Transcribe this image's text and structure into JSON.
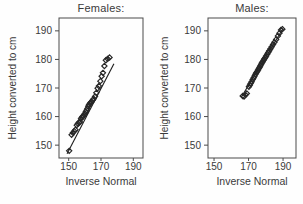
{
  "figure": {
    "background": "#fefefe",
    "text_color": "#3a3a3a",
    "box_color": "#4a4a4a",
    "marker_color": "#272727",
    "fit_line_color": "#1c1c1c"
  },
  "chart_data": [
    {
      "type": "scatter",
      "title": "Females:",
      "xlabel": "Inverse Normal",
      "ylabel": "Height converted to cm",
      "xlim": [
        144,
        196
      ],
      "ylim": [
        145.5,
        194.5
      ],
      "xticks": [
        150,
        170,
        190
      ],
      "yticks": [
        150,
        160,
        170,
        180,
        190
      ],
      "marker": "open-diamond",
      "grid": false,
      "fit_line": {
        "x1": 149.0,
        "y1": 147.0,
        "x2": 178.0,
        "y2": 178.5
      },
      "points": [
        [
          150.3,
          148.0
        ],
        [
          151.8,
          153.6
        ],
        [
          152.6,
          154.3
        ],
        [
          153.4,
          154.9
        ],
        [
          154.2,
          155.4
        ],
        [
          155.0,
          157.0
        ],
        [
          155.7,
          157.5
        ],
        [
          156.3,
          157.9
        ],
        [
          157.0,
          158.1
        ],
        [
          157.6,
          159.2
        ],
        [
          158.1,
          159.7
        ],
        [
          158.6,
          160.0
        ],
        [
          159.1,
          160.2
        ],
        [
          159.6,
          160.7
        ],
        [
          160.1,
          161.1
        ],
        [
          160.6,
          161.7
        ],
        [
          161.1,
          162.2
        ],
        [
          161.6,
          162.8
        ],
        [
          162.1,
          163.6
        ],
        [
          162.6,
          164.1
        ],
        [
          163.1,
          164.6
        ],
        [
          163.6,
          164.9
        ],
        [
          164.2,
          165.2
        ],
        [
          164.8,
          165.7
        ],
        [
          165.5,
          166.2
        ],
        [
          166.3,
          167.0
        ],
        [
          167.1,
          168.3
        ],
        [
          167.9,
          169.9
        ],
        [
          168.7,
          170.7
        ],
        [
          169.6,
          172.4
        ],
        [
          170.4,
          174.1
        ],
        [
          171.2,
          175.3
        ],
        [
          172.1,
          177.7
        ],
        [
          173.0,
          179.7
        ],
        [
          174.1,
          180.2
        ],
        [
          175.3,
          180.7
        ]
      ]
    },
    {
      "type": "scatter",
      "title": "Males:",
      "xlabel": "Inverse Normal",
      "ylabel": "Height converted to cm",
      "xlim": [
        146.5,
        197.5
      ],
      "ylim": [
        145.5,
        194.5
      ],
      "xticks": [
        150,
        170,
        190
      ],
      "yticks": [
        150,
        160,
        170,
        180,
        190
      ],
      "marker": "open-diamond",
      "grid": false,
      "fit_line": {
        "x1": 167.0,
        "y1": 168.0,
        "x2": 190.0,
        "y2": 190.8
      },
      "points": [
        [
          166.6,
          167.2
        ],
        [
          167.4,
          167.0
        ],
        [
          168.2,
          167.6
        ],
        [
          169.0,
          168.1
        ],
        [
          170.2,
          170.4
        ],
        [
          170.7,
          171.0
        ],
        [
          171.2,
          171.6
        ],
        [
          171.8,
          172.2
        ],
        [
          172.4,
          173.0
        ],
        [
          173.0,
          173.6
        ],
        [
          173.5,
          174.2
        ],
        [
          174.0,
          174.8
        ],
        [
          174.5,
          175.3
        ],
        [
          175.0,
          175.8
        ],
        [
          175.5,
          176.3
        ],
        [
          176.0,
          176.8
        ],
        [
          176.4,
          177.3
        ],
        [
          176.9,
          177.8
        ],
        [
          177.3,
          178.3
        ],
        [
          177.8,
          178.8
        ],
        [
          178.2,
          179.2
        ],
        [
          178.7,
          179.7
        ],
        [
          179.2,
          180.2
        ],
        [
          179.7,
          180.7
        ],
        [
          180.2,
          181.2
        ],
        [
          180.8,
          181.8
        ],
        [
          181.4,
          182.4
        ],
        [
          182.0,
          183.0
        ],
        [
          182.7,
          183.7
        ],
        [
          183.4,
          184.4
        ],
        [
          184.2,
          185.2
        ],
        [
          185.0,
          186.0
        ],
        [
          186.0,
          187.0
        ],
        [
          187.0,
          188.2
        ],
        [
          187.9,
          189.2
        ],
        [
          188.8,
          190.3
        ],
        [
          189.6,
          190.6
        ]
      ]
    }
  ]
}
